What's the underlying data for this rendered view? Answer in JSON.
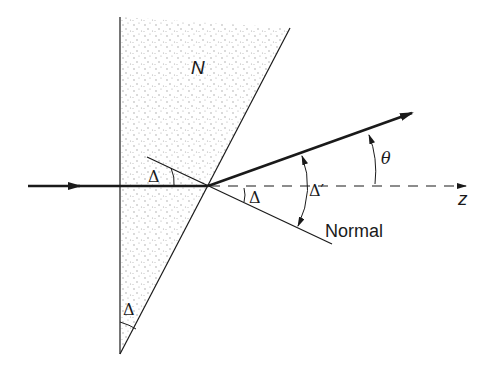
{
  "diagram": {
    "type": "prism-refraction",
    "colors": {
      "line": "#1a1a1a",
      "prism_fill": "#f4f4f4",
      "stipple": "#9a9a9a",
      "background": "#ffffff"
    },
    "labels": {
      "medium": "N",
      "apex_angle": "Δ",
      "incidence_angle": "Δ",
      "normal_angle": "Δ",
      "refraction_angle": "Δ′",
      "deviation_angle": "θ",
      "normal": "Normal",
      "axis": "z"
    }
  }
}
